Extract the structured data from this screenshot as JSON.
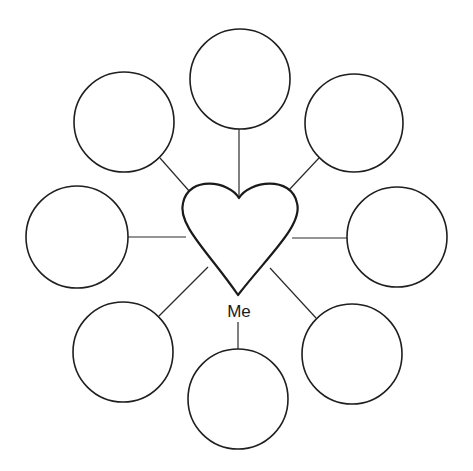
{
  "diagram": {
    "type": "bubble-map",
    "center": {
      "label": "Me",
      "shape": "heart",
      "label_x": 239,
      "label_y": 303,
      "heart": {
        "top_dip": [
          239,
          198
        ],
        "bottom_point": [
          238,
          295
        ],
        "left_extent": 181,
        "right_extent": 299,
        "lobe_top_y": 183
      }
    },
    "nodes": [
      {
        "id": "top",
        "label": "",
        "cx": 240,
        "cy": 79,
        "r": 50
      },
      {
        "id": "upper-right",
        "label": "",
        "cx": 354,
        "cy": 123,
        "r": 49
      },
      {
        "id": "right",
        "label": "",
        "cx": 397,
        "cy": 237,
        "r": 50
      },
      {
        "id": "lower-right",
        "label": "",
        "cx": 352,
        "cy": 354,
        "r": 50
      },
      {
        "id": "bottom",
        "label": "",
        "cx": 238,
        "cy": 399,
        "r": 50
      },
      {
        "id": "lower-left",
        "label": "",
        "cx": 123,
        "cy": 352,
        "r": 50
      },
      {
        "id": "left",
        "label": "",
        "cx": 77,
        "cy": 237,
        "r": 51
      },
      {
        "id": "upper-left",
        "label": "",
        "cx": 124,
        "cy": 122,
        "r": 50
      }
    ],
    "connectors": [
      {
        "to": "top",
        "x1": 239,
        "y1": 129,
        "x2": 239,
        "y2": 198
      },
      {
        "to": "upper-right",
        "x1": 319,
        "y1": 158,
        "x2": 288,
        "y2": 191
      },
      {
        "to": "right",
        "x1": 347,
        "y1": 238,
        "x2": 292,
        "y2": 238
      },
      {
        "to": "lower-right",
        "x1": 316,
        "y1": 318,
        "x2": 270,
        "y2": 268
      },
      {
        "to": "bottom",
        "x1": 238,
        "y1": 322,
        "x2": 238,
        "y2": 349
      },
      {
        "to": "lower-left",
        "x1": 159,
        "y1": 316,
        "x2": 208,
        "y2": 267
      },
      {
        "to": "left",
        "x1": 128,
        "y1": 237,
        "x2": 186,
        "y2": 237
      },
      {
        "to": "upper-left",
        "x1": 160,
        "y1": 158,
        "x2": 190,
        "y2": 192
      }
    ],
    "colors": {
      "stroke": "#1f1f1f",
      "fill": "#ffffff",
      "background": "#ffffff"
    }
  }
}
